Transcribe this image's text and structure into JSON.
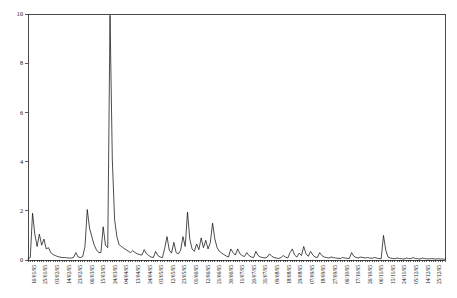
{
  "chart_data": {
    "type": "line",
    "title": "",
    "xlabel": "",
    "ylabel": "",
    "ylim": [
      0,
      10
    ],
    "yticks": [
      0,
      2,
      4,
      6,
      8,
      10
    ],
    "ytick_labels": [
      "0",
      "2",
      "4",
      "6",
      "8",
      "10"
    ],
    "grid": false,
    "legend": "none",
    "x_tick_labels": [
      "16/01/95",
      "25/01/95",
      "03/02/95",
      "14/02/95",
      "23/02/95",
      "06/03/95",
      "15/03/95",
      "24/03/95",
      "04/04/95",
      "13/04/95",
      "24/04/95",
      "03/05/95",
      "12/05/95",
      "23/05/95",
      "01/06/95",
      "12/06/95",
      "21/06/95",
      "30/06/95",
      "11/07/95",
      "20/07/95",
      "31/07/95",
      "09/08/95",
      "18/08/95",
      "29/08/95",
      "07/09/95",
      "18/09/95",
      "27/09/95",
      "06/10/95",
      "17/10/95",
      "26/10/95",
      "06/11/95",
      "15/11/95",
      "24/11/95",
      "05/12/95",
      "14/12/95",
      "25/12/95"
    ],
    "series": [
      {
        "name": "value",
        "color": "#111111",
        "values": [
          0.05,
          0.1,
          1.9,
          1.05,
          0.55,
          1.05,
          0.6,
          0.85,
          0.45,
          0.5,
          0.3,
          0.22,
          0.18,
          0.14,
          0.12,
          0.1,
          0.1,
          0.09,
          0.08,
          0.08,
          0.1,
          0.3,
          0.12,
          0.1,
          0.14,
          0.55,
          2.05,
          1.3,
          0.95,
          0.62,
          0.42,
          0.3,
          0.3,
          1.35,
          0.6,
          0.5,
          9.95,
          4.1,
          1.65,
          0.95,
          0.62,
          0.55,
          0.48,
          0.42,
          0.36,
          0.3,
          0.38,
          0.3,
          0.25,
          0.22,
          0.2,
          0.42,
          0.25,
          0.18,
          0.12,
          0.1,
          0.35,
          0.18,
          0.12,
          0.1,
          0.48,
          0.95,
          0.4,
          0.28,
          0.72,
          0.3,
          0.25,
          0.4,
          0.95,
          0.55,
          1.95,
          0.85,
          0.45,
          0.35,
          0.65,
          0.42,
          0.9,
          0.5,
          0.8,
          0.45,
          0.7,
          1.5,
          0.85,
          0.5,
          0.35,
          0.28,
          0.22,
          0.16,
          0.12,
          0.45,
          0.3,
          0.2,
          0.45,
          0.25,
          0.18,
          0.14,
          0.3,
          0.18,
          0.12,
          0.1,
          0.35,
          0.18,
          0.12,
          0.1,
          0.08,
          0.12,
          0.25,
          0.15,
          0.1,
          0.08,
          0.06,
          0.1,
          0.18,
          0.12,
          0.08,
          0.3,
          0.45,
          0.2,
          0.12,
          0.28,
          0.18,
          0.55,
          0.25,
          0.15,
          0.35,
          0.2,
          0.12,
          0.1,
          0.3,
          0.18,
          0.12,
          0.1,
          0.08,
          0.12,
          0.1,
          0.08,
          0.07,
          0.06,
          0.1,
          0.08,
          0.07,
          0.06,
          0.3,
          0.15,
          0.1,
          0.08,
          0.12,
          0.1,
          0.08,
          0.1,
          0.08,
          0.07,
          0.1,
          0.08,
          0.06,
          0.05,
          1.0,
          0.4,
          0.12,
          0.08,
          0.06,
          0.05,
          0.08,
          0.06,
          0.05,
          0.04,
          0.08,
          0.06,
          0.05,
          0.1,
          0.06,
          0.05,
          0.04,
          0.08,
          0.06,
          0.05,
          0.04,
          0.06,
          0.05,
          0.04,
          0.05,
          0.04,
          0.04,
          0.03
        ]
      }
    ]
  },
  "axes": {
    "y_axis_name": "y-axis",
    "x_axis_name": "x-axis"
  }
}
